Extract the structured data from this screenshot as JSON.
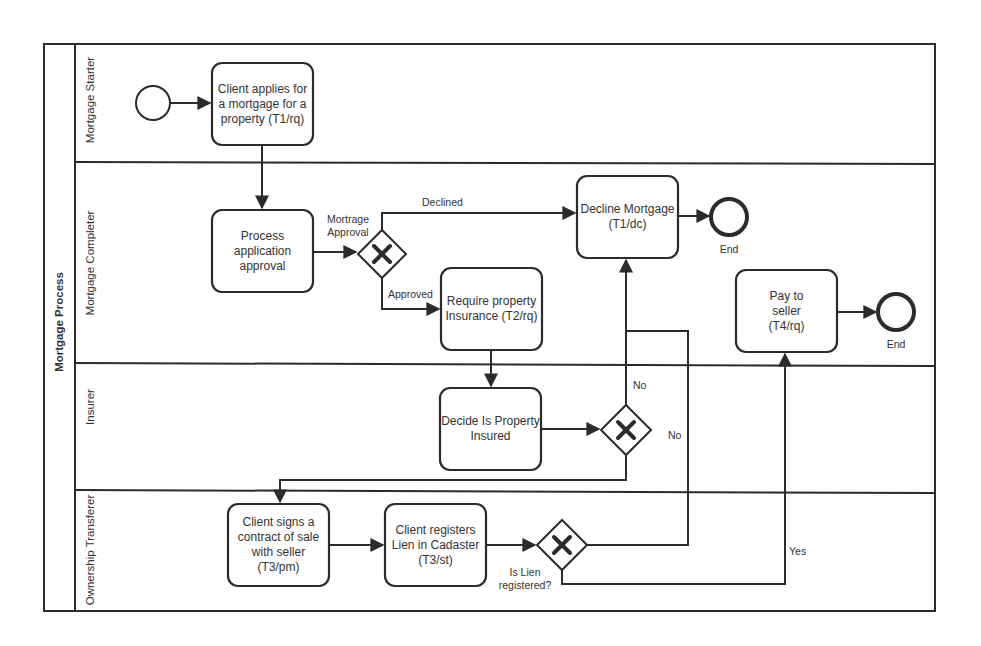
{
  "pool": {
    "title": "Mortgage Process"
  },
  "lanes": [
    {
      "id": "starter",
      "label": "Mortgage Starter"
    },
    {
      "id": "completer",
      "label": "Mortgage Completer"
    },
    {
      "id": "insurer",
      "label": "Insurer"
    },
    {
      "id": "transferer",
      "label": "Ownership Transferer"
    }
  ],
  "tasks": {
    "apply": "Client applies for a mortgage for a property (T1/rq)",
    "process": "Process application approval",
    "decline": "Decline Mortgage (T1/dc)",
    "require_insurance": "Require property Insurance (T2/rq)",
    "pay_seller": "Pay to seller (T4/rq)",
    "decide_insured": "Decide Is Property Insured",
    "sign_contract": "Client signs a contract of sale with seller (T3/pm)",
    "register_lien": "Client registers Lien in Cadaster (T3/st)"
  },
  "gateways": {
    "approval": "Mortrage Approval",
    "lien": "Is Lien registered?"
  },
  "events": {
    "end_decline": "End",
    "end_pay": "End"
  },
  "flow_labels": {
    "declined": "Declined",
    "approved": "Approved",
    "insured_no": "No",
    "lien_no": "No",
    "lien_yes": "Yes"
  },
  "colors": {
    "line": "#2b2b2b",
    "background": "#ffffff"
  }
}
